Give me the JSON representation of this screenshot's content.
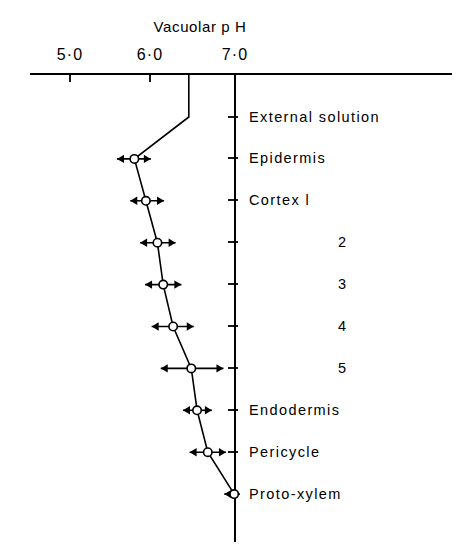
{
  "chart": {
    "title": "Vacuolar p H",
    "x_axis_ticks": [
      "5·0",
      "6·0",
      "7·0"
    ],
    "row_labels": [
      "External solution",
      "Epidermis",
      "Cortex  l",
      "2",
      "3",
      "4",
      "5",
      "Endodermis",
      "Pericycle",
      "Proto-xylem"
    ]
  },
  "chart_data": {
    "type": "line",
    "orientation": "horizontal",
    "title": "Vacuolar p H",
    "xlabel": "Vacuolar p H",
    "ylabel": "",
    "xlim": [
      4.6,
      7.6
    ],
    "xticks": [
      5.0,
      6.0,
      7.0
    ],
    "xtick_labels": [
      "5·0",
      "6·0",
      "7·0"
    ],
    "grid": false,
    "legend": "none",
    "categories": [
      "External solution",
      "Epidermis",
      "Cortex l",
      "2",
      "3",
      "4",
      "5",
      "Endodermis",
      "Pericycle",
      "Proto-xylem"
    ],
    "values": [
      6.44,
      5.78,
      5.92,
      6.06,
      6.13,
      6.25,
      6.47,
      6.54,
      6.67,
      6.99
    ],
    "error_low": [
      6.44,
      5.57,
      5.73,
      5.85,
      5.91,
      5.99,
      6.1,
      6.37,
      6.45,
      6.87
    ],
    "error_high": [
      6.44,
      5.98,
      6.14,
      6.28,
      6.35,
      6.5,
      6.86,
      6.72,
      6.89,
      7.06
    ],
    "points": [
      {
        "label": "External solution",
        "ph": 6.44,
        "marker": "none",
        "error_bars": false
      },
      {
        "label": "Epidermis",
        "ph": 5.78,
        "marker": "open-circle",
        "error_bars": true,
        "err_low": 5.57,
        "err_high": 5.98
      },
      {
        "label": "Cortex l",
        "ph": 5.92,
        "marker": "open-circle",
        "error_bars": true,
        "err_low": 5.73,
        "err_high": 6.14
      },
      {
        "label": "2",
        "ph": 6.06,
        "marker": "open-circle",
        "error_bars": true,
        "err_low": 5.85,
        "err_high": 6.28
      },
      {
        "label": "3",
        "ph": 6.13,
        "marker": "open-circle",
        "error_bars": true,
        "err_low": 5.91,
        "err_high": 6.35
      },
      {
        "label": "4",
        "ph": 6.25,
        "marker": "open-circle",
        "error_bars": true,
        "err_low": 5.99,
        "err_high": 6.5
      },
      {
        "label": "5",
        "ph": 6.47,
        "marker": "open-circle",
        "error_bars": true,
        "err_low": 6.1,
        "err_high": 6.86
      },
      {
        "label": "Endodermis",
        "ph": 6.54,
        "marker": "open-circle",
        "error_bars": true,
        "err_low": 6.37,
        "err_high": 6.72
      },
      {
        "label": "Pericycle",
        "ph": 6.67,
        "marker": "open-circle",
        "error_bars": true,
        "err_low": 6.45,
        "err_high": 6.89
      },
      {
        "label": "Proto-xylem",
        "ph": 6.99,
        "marker": "open-circle",
        "error_bars": true,
        "err_low": 6.87,
        "err_high": 7.06
      }
    ],
    "reference_line": {
      "ph": 7.0,
      "orientation": "vertical",
      "note": "axis at pH 7·0"
    },
    "colors": {
      "line": "#000000",
      "axis": "#000000",
      "marker_fill": "#ffffff"
    }
  }
}
